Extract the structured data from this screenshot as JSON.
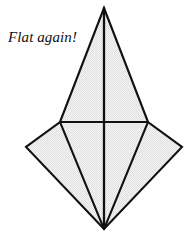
{
  "figure": {
    "kind": "origami-fold-diagram",
    "canvas": {
      "width": 192,
      "height": 238
    },
    "background_color": "#ffffff",
    "caption": {
      "text": "Flat again!",
      "style": "italic-serif",
      "color": "#101010",
      "x": 8,
      "y": 29
    },
    "paper": {
      "fill_color": "#ededed",
      "stroke_color": "#111111",
      "outer_stroke_width": 2.1,
      "inner_stroke_width": 1.9
    },
    "points": {
      "apex": {
        "x": 104,
        "y": 8
      },
      "left_shoulder": {
        "x": 60,
        "y": 122
      },
      "right_shoulder": {
        "x": 148,
        "y": 122
      },
      "left_tip": {
        "x": 26,
        "y": 147
      },
      "right_tip": {
        "x": 182,
        "y": 147
      },
      "bottom": {
        "x": 104,
        "y": 229
      }
    },
    "outline_path": "M 104 8 L 148 122 L 182 147 L 104 229 L 26 147 L 60 122 Z",
    "creases": [
      {
        "name": "vertical-center-crease",
        "path": "M 104 8 L 104 229",
        "width": 2.3
      },
      {
        "name": "horizontal-crease",
        "path": "M 60 122 L 148 122",
        "width": 1.9
      },
      {
        "name": "left-inner-crease",
        "path": "M 60 122 L 104 229",
        "width": 2.0
      },
      {
        "name": "right-inner-crease",
        "path": "M 148 122 L 104 229",
        "width": 2.0
      }
    ],
    "panels": [
      {
        "name": "upper-left-panel",
        "path": "M 104 8 L 104 122 L 60 122 Z"
      },
      {
        "name": "upper-right-panel",
        "path": "M 104 8 L 148 122 L 104 122 Z"
      },
      {
        "name": "left-wing-panel",
        "path": "M 60 122 L 26 147 L 104 229 Z"
      },
      {
        "name": "right-wing-panel",
        "path": "M 148 122 L 182 147 L 104 229 Z"
      },
      {
        "name": "lower-left-panel",
        "path": "M 60 122 L 104 229 L 104 122 Z"
      },
      {
        "name": "lower-right-panel",
        "path": "M 148 122 L 104 122 L 104 229 Z"
      }
    ]
  }
}
